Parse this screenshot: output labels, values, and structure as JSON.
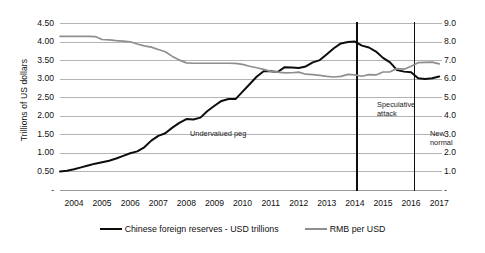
{
  "chart_data": {
    "type": "line",
    "title": "",
    "xlabel": "",
    "ylabel": "Trillions of US dollars",
    "y2label": "",
    "grid": true,
    "legend_position": "bottom",
    "xlim": [
      2004,
      2017.6
    ],
    "ylim": [
      0,
      4.5
    ],
    "y2lim": [
      0,
      9.0
    ],
    "x_tick_labels": [
      "2004",
      "2005",
      "2006",
      "2007",
      "2008",
      "2009",
      "2010",
      "2011",
      "2012",
      "2013",
      "2014",
      "2015",
      "2016",
      "2017"
    ],
    "y_tick_labels": [
      "4.50",
      "4.00",
      "3.50",
      "3.00",
      "2.50",
      "2.00",
      "1.50",
      "1.00",
      "0.50",
      "-"
    ],
    "y_tick_values": [
      4.5,
      4.0,
      3.5,
      3.0,
      2.5,
      2.0,
      1.5,
      1.0,
      0.5,
      0
    ],
    "y2_tick_labels": [
      "9.0",
      "8.0",
      "7.0",
      "6.0",
      "5.0",
      "4.0",
      "3.0",
      "2.0",
      "1.0",
      "-"
    ],
    "y2_tick_values": [
      9.0,
      8.0,
      7.0,
      6.0,
      5.0,
      4.0,
      3.0,
      2.0,
      1.0,
      0
    ],
    "series": [
      {
        "name": "Chinese foreign reserves - USD trillions",
        "axis": "left",
        "color": "#0d0d0d",
        "x": [
          2004.0,
          2004.25,
          2004.5,
          2004.75,
          2005.0,
          2005.25,
          2005.5,
          2005.75,
          2006.0,
          2006.25,
          2006.5,
          2006.75,
          2007.0,
          2007.25,
          2007.5,
          2007.75,
          2008.0,
          2008.25,
          2008.5,
          2008.75,
          2009.0,
          2009.25,
          2009.5,
          2009.75,
          2010.0,
          2010.25,
          2010.5,
          2010.75,
          2011.0,
          2011.25,
          2011.5,
          2011.75,
          2012.0,
          2012.25,
          2012.5,
          2012.75,
          2013.0,
          2013.25,
          2013.5,
          2013.75,
          2014.0,
          2014.25,
          2014.5,
          2014.75,
          2015.0,
          2015.25,
          2015.5,
          2015.75,
          2016.0,
          2016.25,
          2016.5,
          2016.75,
          2017.0,
          2017.25,
          2017.5
        ],
        "values": [
          0.5,
          0.52,
          0.56,
          0.61,
          0.66,
          0.71,
          0.75,
          0.79,
          0.85,
          0.92,
          0.99,
          1.04,
          1.15,
          1.33,
          1.46,
          1.53,
          1.68,
          1.81,
          1.91,
          1.9,
          1.95,
          2.13,
          2.27,
          2.4,
          2.45,
          2.45,
          2.65,
          2.85,
          3.05,
          3.2,
          3.2,
          3.18,
          3.31,
          3.3,
          3.29,
          3.33,
          3.44,
          3.5,
          3.66,
          3.82,
          3.95,
          3.99,
          4.0,
          3.89,
          3.84,
          3.73,
          3.56,
          3.44,
          3.23,
          3.19,
          3.17,
          3.01,
          2.99,
          3.01,
          3.06
        ]
      },
      {
        "name": "RMB per USD",
        "axis": "right",
        "color": "#8f8f8f",
        "x": [
          2004.0,
          2004.25,
          2004.5,
          2004.75,
          2005.0,
          2005.25,
          2005.5,
          2005.75,
          2006.0,
          2006.25,
          2006.5,
          2006.75,
          2007.0,
          2007.25,
          2007.5,
          2007.75,
          2008.0,
          2008.25,
          2008.5,
          2008.75,
          2009.0,
          2009.25,
          2009.5,
          2009.75,
          2010.0,
          2010.25,
          2010.5,
          2010.75,
          2011.0,
          2011.25,
          2011.5,
          2011.75,
          2012.0,
          2012.25,
          2012.5,
          2012.75,
          2013.0,
          2013.25,
          2013.5,
          2013.75,
          2014.0,
          2014.25,
          2014.5,
          2014.75,
          2015.0,
          2015.25,
          2015.5,
          2015.75,
          2016.0,
          2016.25,
          2016.5,
          2016.75,
          2017.0,
          2017.25,
          2017.5
        ],
        "values": [
          8.28,
          8.28,
          8.28,
          8.28,
          8.28,
          8.27,
          8.11,
          8.09,
          8.05,
          8.02,
          7.99,
          7.87,
          7.77,
          7.7,
          7.57,
          7.45,
          7.2,
          7.0,
          6.85,
          6.83,
          6.83,
          6.83,
          6.83,
          6.83,
          6.83,
          6.82,
          6.77,
          6.67,
          6.59,
          6.5,
          6.39,
          6.35,
          6.31,
          6.32,
          6.35,
          6.24,
          6.22,
          6.18,
          6.12,
          6.09,
          6.12,
          6.23,
          6.2,
          6.13,
          6.22,
          6.2,
          6.36,
          6.37,
          6.54,
          6.51,
          6.67,
          6.86,
          6.88,
          6.89,
          6.8
        ]
      }
    ],
    "annotations": [
      {
        "text": "Undervalued peg",
        "x": 2010.3,
        "y": 1.55
      },
      {
        "text": "Speculative attack",
        "x": 2015.1,
        "y": 2.2
      },
      {
        "text": "New normal",
        "x": 2016.8,
        "y": 1.55
      }
    ],
    "vertical_dividers": [
      {
        "x": 2014.55,
        "label": "speculative-attack-start"
      },
      {
        "x": 2016.6,
        "label": "new-normal-start"
      }
    ]
  },
  "annotations_text": {
    "undervalued_peg": "Undervalued peg",
    "speculative_attack_line1": "Speculative",
    "speculative_attack_line2": "attack",
    "new_normal_line1": "New",
    "new_normal_line2": "normal"
  },
  "axis": {
    "y_title": "Trillions of US dollars"
  },
  "legend": {
    "items": [
      {
        "label": "Chinese foreign reserves - USD trillions",
        "color": "#0d0d0d"
      },
      {
        "label": "RMB per USD",
        "color": "#8f8f8f"
      }
    ]
  }
}
